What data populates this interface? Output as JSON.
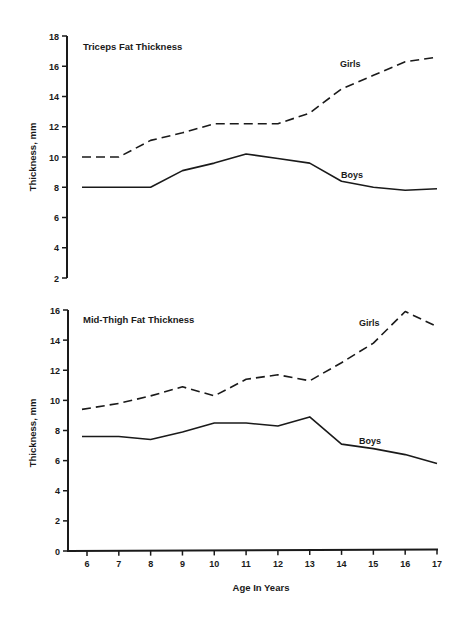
{
  "chart_data": [
    {
      "type": "line",
      "title": "Triceps Fat Thickness",
      "xlabel": "",
      "ylabel": "Thickness, mm",
      "x": [
        6,
        7,
        8,
        9,
        10,
        11,
        12,
        13,
        14,
        15,
        16,
        17
      ],
      "ylim": [
        2,
        18
      ],
      "yticks": [
        2,
        4,
        6,
        8,
        10,
        12,
        14,
        16,
        18
      ],
      "grid": false,
      "legend": "inline labels",
      "series": [
        {
          "name": "Girls",
          "style": "dashed",
          "values": [
            10.0,
            10.0,
            11.1,
            11.6,
            12.2,
            12.2,
            12.2,
            12.9,
            14.5,
            15.4,
            16.3,
            16.6
          ]
        },
        {
          "name": "Boys",
          "style": "solid",
          "values": [
            8.0,
            8.0,
            8.0,
            9.1,
            9.6,
            10.2,
            9.9,
            9.6,
            8.4,
            8.0,
            7.8,
            7.9
          ]
        }
      ]
    },
    {
      "type": "line",
      "title": "Mid-Thigh Fat Thickness",
      "xlabel": "Age In Years",
      "ylabel": "Thickness, mm",
      "x": [
        6,
        7,
        8,
        9,
        10,
        11,
        12,
        13,
        14,
        15,
        16,
        17
      ],
      "xticks": [
        "6",
        "7",
        "8",
        "9",
        "10",
        "11",
        "12",
        "13",
        "14",
        "15",
        "16",
        "17"
      ],
      "ylim": [
        0,
        16
      ],
      "yticks": [
        0,
        2,
        4,
        6,
        8,
        10,
        12,
        14,
        16
      ],
      "grid": false,
      "legend": "inline labels",
      "series": [
        {
          "name": "Girls",
          "style": "dashed",
          "values": [
            9.4,
            9.8,
            10.3,
            10.9,
            10.3,
            11.4,
            11.7,
            11.3,
            12.5,
            13.8,
            15.9,
            14.9
          ]
        },
        {
          "name": "Boys",
          "style": "solid",
          "values": [
            7.6,
            7.6,
            7.4,
            7.9,
            8.5,
            8.5,
            8.3,
            8.9,
            7.1,
            6.8,
            6.4,
            5.8
          ]
        }
      ]
    }
  ],
  "colors": {
    "line": "#1a1a1a",
    "background": "#ffffff"
  }
}
